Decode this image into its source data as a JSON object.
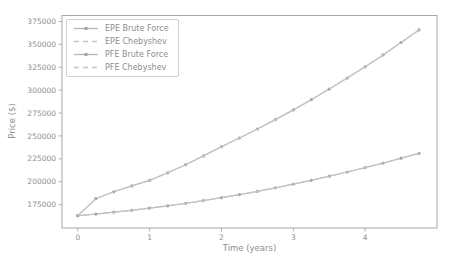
{
  "figure": {
    "background": "#ffffff",
    "frame_color": "#a8a8a8",
    "text_color": "#8e8e8e",
    "legend_border_color": "#cfcfcf"
  },
  "chart_data": {
    "type": "line",
    "xlabel": "Time (years)",
    "ylabel": "Price ($)",
    "xlim": [
      -0.22,
      5.0
    ],
    "ylim": [
      149500,
      381500
    ],
    "xticks": [
      0,
      1,
      2,
      3,
      4
    ],
    "yticks": [
      175000,
      200000,
      225000,
      250000,
      275000,
      300000,
      325000,
      350000,
      375000
    ],
    "grid": false,
    "legend_position": "upper left",
    "x": [
      0,
      0.25,
      0.5,
      0.75,
      1.0,
      1.25,
      1.5,
      1.75,
      2.0,
      2.25,
      2.5,
      2.75,
      3.0,
      3.25,
      3.5,
      3.75,
      4.0,
      4.25,
      4.5,
      4.75
    ],
    "series": [
      {
        "name": "EPE Brute Force",
        "style": "solid-marker",
        "color": "#b6b6b6",
        "marker_color": "#a2a2a2",
        "values": [
          163000,
          164700,
          166700,
          168800,
          171200,
          173700,
          176500,
          179400,
          182600,
          186000,
          189600,
          193400,
          197400,
          201600,
          206000,
          210600,
          215400,
          220400,
          225700,
          231100
        ]
      },
      {
        "name": "EPE Chebyshev",
        "style": "dashed",
        "color": "#c6c6c6",
        "values": [
          163000,
          164700,
          166700,
          168800,
          171200,
          173700,
          176500,
          179400,
          182600,
          186000,
          189600,
          193400,
          197400,
          201600,
          206000,
          210600,
          215400,
          220400,
          225700,
          231100
        ]
      },
      {
        "name": "PFE Brute Force",
        "style": "solid-marker",
        "color": "#b6b6b6",
        "marker_color": "#a2a2a2",
        "values": [
          163000,
          181500,
          189000,
          195500,
          201500,
          209800,
          218600,
          228200,
          238300,
          247800,
          257600,
          267800,
          278400,
          289600,
          301200,
          313200,
          325500,
          338500,
          352000,
          365800
        ]
      },
      {
        "name": "PFE Chebyshev",
        "style": "dashed",
        "color": "#c6c6c6",
        "values": [
          163000,
          181500,
          189000,
          195500,
          201500,
          209800,
          218600,
          228200,
          238300,
          247800,
          257600,
          267800,
          278400,
          289600,
          301200,
          313200,
          325500,
          338500,
          352000,
          365800
        ]
      }
    ]
  }
}
